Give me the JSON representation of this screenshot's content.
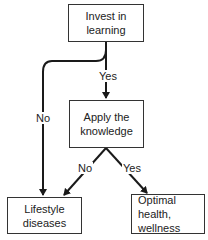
{
  "diagram": {
    "type": "flowchart",
    "nodes": [
      {
        "id": "invest",
        "line1": "Invest in",
        "line2": "learning"
      },
      {
        "id": "apply",
        "line1": "Apply the",
        "line2": "knowledge"
      },
      {
        "id": "lifestyle",
        "line1": "Lifestyle",
        "line2": "diseases"
      },
      {
        "id": "optimal",
        "line1": "Optimal health,",
        "line2": "wellness"
      }
    ],
    "edges": [
      {
        "from": "invest",
        "to": "apply",
        "label": "Yes"
      },
      {
        "from": "invest",
        "to": "lifestyle",
        "label": "No"
      },
      {
        "from": "apply",
        "to": "lifestyle",
        "label": "No"
      },
      {
        "from": "apply",
        "to": "optimal",
        "label": "Yes"
      }
    ],
    "line_color": "#1a1a1a",
    "box_border_color": "#333333"
  }
}
